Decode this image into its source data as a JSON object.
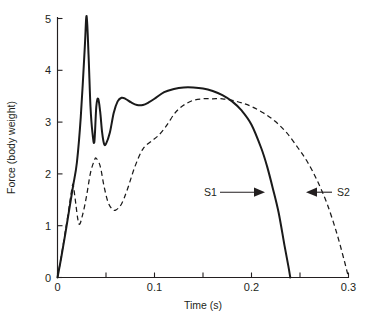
{
  "figure": {
    "background_color": "#ffffff",
    "ink_color": "#231f20"
  },
  "chart_data": {
    "type": "line",
    "title": "",
    "subtitle": "",
    "xlabel": "Time (s)",
    "ylabel": "Force (body weight)",
    "xlim": [
      0,
      0.3
    ],
    "ylim": [
      0,
      5
    ],
    "xticks": [
      0,
      0.1,
      0.2,
      0.3
    ],
    "xtick_labels": [
      "0",
      "0.1",
      "0.2",
      "0.3"
    ],
    "yticks": [
      0,
      1,
      2,
      3,
      4,
      5
    ],
    "ytick_labels": [
      "0",
      "1",
      "2",
      "3",
      "4",
      "5"
    ],
    "grid": false,
    "legend": "inline-annotations",
    "series": [
      {
        "name": "S1",
        "style": "solid",
        "color": "#1a1a1a",
        "annotation": "S1",
        "description": "Rearfoot-strike style vertical ground reaction force with sharp impact transient peak of 5.05 body weights at 0.030 s",
        "x": [
          0.0,
          0.004,
          0.008,
          0.012,
          0.016,
          0.02,
          0.024,
          0.028,
          0.03,
          0.032,
          0.034,
          0.036,
          0.038,
          0.04,
          0.042,
          0.044,
          0.046,
          0.048,
          0.05,
          0.054,
          0.058,
          0.062,
          0.066,
          0.07,
          0.076,
          0.082,
          0.088,
          0.094,
          0.1,
          0.11,
          0.12,
          0.13,
          0.14,
          0.15,
          0.16,
          0.17,
          0.18,
          0.19,
          0.2,
          0.21,
          0.216,
          0.222,
          0.228,
          0.234,
          0.238,
          0.24
        ],
        "y": [
          0.0,
          0.4,
          0.84,
          1.3,
          1.76,
          2.22,
          3.1,
          4.4,
          5.05,
          4.3,
          3.3,
          2.8,
          2.62,
          3.3,
          3.45,
          3.2,
          2.8,
          2.58,
          2.58,
          2.8,
          3.18,
          3.4,
          3.47,
          3.45,
          3.38,
          3.33,
          3.33,
          3.38,
          3.45,
          3.58,
          3.64,
          3.67,
          3.67,
          3.65,
          3.6,
          3.52,
          3.4,
          3.22,
          2.95,
          2.5,
          2.15,
          1.72,
          1.25,
          0.62,
          0.22,
          0.0
        ]
      },
      {
        "name": "S2",
        "style": "dashed",
        "color": "#1a1a1a",
        "annotation": "S2",
        "description": "Forefoot-strike style vertical ground reaction force without distinct impact peak, broad maximum of 3.45 body weights at 0.155 s",
        "x": [
          0.0,
          0.004,
          0.008,
          0.012,
          0.014,
          0.016,
          0.018,
          0.022,
          0.026,
          0.03,
          0.034,
          0.038,
          0.04,
          0.044,
          0.048,
          0.052,
          0.056,
          0.06,
          0.066,
          0.072,
          0.08,
          0.088,
          0.096,
          0.104,
          0.112,
          0.12,
          0.126,
          0.132,
          0.14,
          0.15,
          0.16,
          0.17,
          0.18,
          0.19,
          0.2,
          0.212,
          0.224,
          0.236,
          0.248,
          0.258,
          0.268,
          0.278,
          0.288,
          0.296,
          0.3
        ],
        "y": [
          0.0,
          0.42,
          0.88,
          1.36,
          1.62,
          1.8,
          1.55,
          1.04,
          1.22,
          1.58,
          2.02,
          2.26,
          2.3,
          2.15,
          1.76,
          1.46,
          1.33,
          1.3,
          1.42,
          1.7,
          2.15,
          2.48,
          2.62,
          2.74,
          2.92,
          3.15,
          3.27,
          3.35,
          3.42,
          3.45,
          3.45,
          3.45,
          3.42,
          3.37,
          3.3,
          3.18,
          3.02,
          2.8,
          2.5,
          2.22,
          1.86,
          1.42,
          0.85,
          0.3,
          0.0
        ]
      }
    ],
    "annotations": [
      {
        "label": "S1",
        "points_to_series": "S1",
        "arrow_direction": "right",
        "label_x": 0.151,
        "tip_x": 0.211,
        "y": 1.56
      },
      {
        "label": "S2",
        "points_to_series": "S2",
        "arrow_direction": "left",
        "label_x": 0.293,
        "tip_x": 0.257,
        "y": 1.56
      }
    ]
  }
}
